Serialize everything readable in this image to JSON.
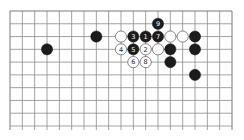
{
  "diagram": {
    "type": "go-board-fragment",
    "columns": 19,
    "rows_shown": 10,
    "open_edge": "bottom",
    "colors": {
      "black": "#1c1c1c",
      "white": "#ffffff",
      "grid": "#8a8a8a",
      "background": "#ffffff"
    },
    "stones": [
      {
        "color": "black",
        "col": 3,
        "row": 3,
        "label": ""
      },
      {
        "color": "black",
        "col": 7,
        "row": 2,
        "label": ""
      },
      {
        "color": "black",
        "col": 12,
        "row": 1,
        "label": "9"
      },
      {
        "color": "white",
        "col": 9,
        "row": 2,
        "label": ""
      },
      {
        "color": "black",
        "col": 10,
        "row": 2,
        "label": "3"
      },
      {
        "color": "black",
        "col": 11,
        "row": 2,
        "label": "1"
      },
      {
        "color": "black",
        "col": 12,
        "row": 2,
        "label": "7"
      },
      {
        "color": "white",
        "col": 13,
        "row": 2,
        "label": ""
      },
      {
        "color": "white",
        "col": 14,
        "row": 2,
        "label": ""
      },
      {
        "color": "black",
        "col": 15,
        "row": 2,
        "label": ""
      },
      {
        "color": "white",
        "col": 9,
        "row": 3,
        "label": "4"
      },
      {
        "color": "black",
        "col": 10,
        "row": 3,
        "label": "5"
      },
      {
        "color": "white",
        "col": 11,
        "row": 3,
        "label": "2"
      },
      {
        "color": "white",
        "col": 12,
        "row": 3,
        "label": ""
      },
      {
        "color": "black",
        "col": 13,
        "row": 3,
        "label": ""
      },
      {
        "color": "black",
        "col": 15,
        "row": 3,
        "label": ""
      },
      {
        "color": "white",
        "col": 10,
        "row": 4,
        "label": "6"
      },
      {
        "color": "white",
        "col": 11,
        "row": 4,
        "label": "8"
      },
      {
        "color": "black",
        "col": 13,
        "row": 4,
        "label": ""
      },
      {
        "color": "black",
        "col": 15,
        "row": 5,
        "label": ""
      }
    ]
  }
}
